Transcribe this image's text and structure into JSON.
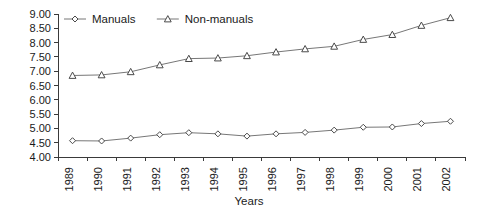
{
  "chart_data": {
    "type": "line",
    "title": "",
    "xlabel": "Years",
    "ylabel": "",
    "categories": [
      "1989",
      "1990",
      "1991",
      "1992",
      "1993",
      "1994",
      "1995",
      "1996",
      "1997",
      "1998",
      "1999",
      "2000",
      "2001",
      "2002"
    ],
    "series": [
      {
        "name": "Manuals",
        "marker": "diamond",
        "color": "#777777",
        "values": [
          4.57,
          4.56,
          4.66,
          4.78,
          4.85,
          4.81,
          4.73,
          4.81,
          4.86,
          4.94,
          5.04,
          5.05,
          5.17,
          5.25
        ]
      },
      {
        "name": "Non-manuals",
        "marker": "triangle",
        "color": "#777777",
        "values": [
          6.85,
          6.87,
          6.98,
          7.22,
          7.44,
          7.46,
          7.54,
          7.67,
          7.78,
          7.87,
          8.11,
          8.28,
          8.6,
          8.87
        ]
      }
    ],
    "ylim": [
      4.0,
      9.0
    ],
    "ytick_step": 0.5,
    "ytick_labels": [
      "9.00",
      "8.50",
      "8.00",
      "7.50",
      "7.00",
      "6.50",
      "6.00",
      "5.50",
      "5.00",
      "4.50",
      "4.00"
    ],
    "grid": false,
    "legend_position": "top-left",
    "xtick_label_rotation": -90
  },
  "legend": {
    "items": [
      {
        "label": "Manuals",
        "marker": "diamond"
      },
      {
        "label": "Non-manuals",
        "marker": "triangle"
      }
    ]
  },
  "axis": {
    "x_title": "Years"
  }
}
